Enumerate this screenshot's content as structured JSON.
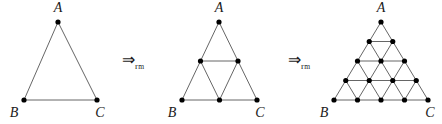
{
  "figure": {
    "background_color": "#ffffff",
    "stroke_color": "#555555",
    "vertex_color": "#000000",
    "label_color": "#1a1a1a",
    "caption": "Triangle refinement sequence",
    "panels": [
      {
        "id": "panel-1",
        "name": "triangle-level-1",
        "level": 1,
        "divisions": 1,
        "vertex_count": 3,
        "sub_triangle_count": 1,
        "apex": {
          "x": 58,
          "y": 22,
          "label": "A"
        },
        "bottom_left": {
          "x": 24,
          "y": 100,
          "label": "B"
        },
        "bottom_right": {
          "x": 97,
          "y": 100,
          "label": "C"
        },
        "labels": {
          "A": {
            "text": "A",
            "x": 58,
            "y": 12
          },
          "B": {
            "text": "B",
            "x": 14,
            "y": 117
          },
          "C": {
            "text": "C",
            "x": 100,
            "y": 117
          }
        }
      },
      {
        "id": "panel-2",
        "name": "triangle-level-2",
        "level": 2,
        "divisions": 2,
        "vertex_count": 6,
        "sub_triangle_count": 4,
        "apex": {
          "x": 219,
          "y": 22,
          "label": "A"
        },
        "bottom_left": {
          "x": 182,
          "y": 100,
          "label": "B"
        },
        "bottom_right": {
          "x": 257,
          "y": 100,
          "label": "C"
        },
        "labels": {
          "A": {
            "text": "A",
            "x": 219,
            "y": 12
          },
          "B": {
            "text": "B",
            "x": 172,
            "y": 117
          },
          "C": {
            "text": "C",
            "x": 260,
            "y": 117
          }
        }
      },
      {
        "id": "panel-3",
        "name": "triangle-level-4",
        "level": 3,
        "divisions": 4,
        "vertex_count": 15,
        "sub_triangle_count": 16,
        "apex": {
          "x": 381,
          "y": 22,
          "label": "A"
        },
        "bottom_left": {
          "x": 334,
          "y": 100,
          "label": "B"
        },
        "bottom_right": {
          "x": 428,
          "y": 100,
          "label": "C"
        },
        "labels": {
          "A": {
            "text": "A",
            "x": 381,
            "y": 12
          },
          "B": {
            "text": "B",
            "x": 324,
            "y": 117
          },
          "C": {
            "text": "C",
            "x": 430,
            "y": 117
          }
        }
      }
    ],
    "operators": [
      {
        "id": "arrow-1",
        "name": "refinement-arrow-1",
        "glyph": "⇒",
        "subscript_main": "r",
        "subscript_sub": "m",
        "x": 122,
        "y": 52
      },
      {
        "id": "arrow-2",
        "name": "refinement-arrow-2",
        "glyph": "⇒",
        "subscript_main": "r",
        "subscript_sub": "m",
        "x": 288,
        "y": 52
      }
    ]
  }
}
